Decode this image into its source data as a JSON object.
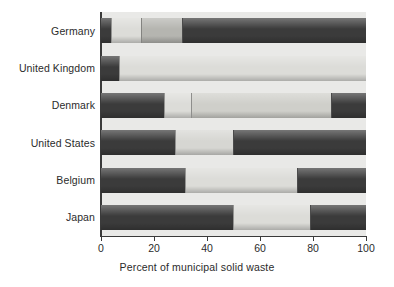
{
  "chart_data": {
    "type": "bar",
    "orientation": "horizontal",
    "stacked": true,
    "title": "",
    "subtitle": "",
    "xlabel": "Percent of municipal solid waste",
    "ylabel": "",
    "xlim": [
      0,
      100
    ],
    "xticks": [
      0,
      20,
      40,
      60,
      80,
      100
    ],
    "xtick_labels": [
      "0",
      "20",
      "40",
      "60",
      "80",
      "100"
    ],
    "grid": false,
    "legend": "none",
    "categories": [
      "Germany",
      "United Kingdom",
      "Denmark",
      "United States",
      "Belgium",
      "Japan"
    ],
    "series": [
      {
        "name": "segment-1",
        "color": "#3b3b3b",
        "values": [
          4,
          7,
          24,
          28,
          32,
          50
        ]
      },
      {
        "name": "segment-2",
        "color": "#d8d8d4",
        "values": [
          11,
          93,
          10,
          22,
          42,
          29
        ]
      },
      {
        "name": "segment-3",
        "color": "#b9b9b4",
        "values": [
          15,
          0,
          53,
          0,
          0,
          0
        ]
      },
      {
        "name": "segment-4",
        "color": "#3b3b3b",
        "values": [
          70,
          0,
          13,
          50,
          26,
          21
        ]
      }
    ],
    "rows": [
      {
        "category": "Germany",
        "segments": [
          {
            "value": 4,
            "color": "#3b3b3b"
          },
          {
            "value": 11,
            "color": "#dcdcd8"
          },
          {
            "value": 15,
            "color": "#b5b5b0"
          },
          {
            "value": 70,
            "color": "#3b3b3b"
          }
        ]
      },
      {
        "category": "United Kingdom",
        "segments": [
          {
            "value": 7,
            "color": "#3b3b3b"
          },
          {
            "value": 93,
            "color": "#dcdcd8"
          }
        ]
      },
      {
        "category": "Denmark",
        "segments": [
          {
            "value": 24,
            "color": "#3b3b3b"
          },
          {
            "value": 10,
            "color": "#dcdcd8"
          },
          {
            "value": 53,
            "color": "#cfcfca"
          },
          {
            "value": 13,
            "color": "#3b3b3b"
          }
        ]
      },
      {
        "category": "United States",
        "segments": [
          {
            "value": 28,
            "color": "#3b3b3b"
          },
          {
            "value": 22,
            "color": "#d6d6d2"
          },
          {
            "value": 50,
            "color": "#3b3b3b"
          }
        ]
      },
      {
        "category": "Belgium",
        "segments": [
          {
            "value": 32,
            "color": "#3b3b3b"
          },
          {
            "value": 42,
            "color": "#dcdcd8"
          },
          {
            "value": 26,
            "color": "#3b3b3b"
          }
        ]
      },
      {
        "category": "Japan",
        "segments": [
          {
            "value": 50,
            "color": "#3b3b3b"
          },
          {
            "value": 29,
            "color": "#dcdcd8"
          },
          {
            "value": 21,
            "color": "#3b3b3b"
          }
        ]
      }
    ]
  },
  "colors": {
    "plot_background": "#e9e9e7",
    "axis": "#3a3a3a",
    "text": "#2b2b2b",
    "dark_segment": "#3b3b3b",
    "light_segment": "#dcdcd8",
    "mid_segment": "#b5b5b0"
  }
}
